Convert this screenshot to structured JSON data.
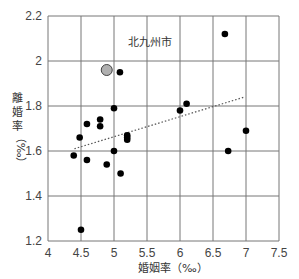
{
  "chart_data": {
    "type": "scatter",
    "title": "",
    "annotation": "北九州市",
    "xlabel": "婚姻率（‰）",
    "ylabel": "離婚率（‰）",
    "xlim": [
      4,
      7.5
    ],
    "ylim": [
      1.2,
      2.2
    ],
    "xticks": [
      "4",
      "4.5",
      "5",
      "5.5",
      "6",
      "6.5",
      "7",
      "7.5"
    ],
    "yticks": [
      "1.2",
      "1.4",
      "1.6",
      "1.8",
      "2",
      "2.2"
    ],
    "grid": true,
    "highlight": {
      "name": "北九州市",
      "x": 4.89,
      "y": 1.96,
      "color": "#b0b0b0"
    },
    "points": [
      {
        "x": 5.09,
        "y": 1.95
      },
      {
        "x": 6.68,
        "y": 2.12
      },
      {
        "x": 5.0,
        "y": 1.79
      },
      {
        "x": 6.1,
        "y": 1.81
      },
      {
        "x": 6.0,
        "y": 1.78
      },
      {
        "x": 4.59,
        "y": 1.72
      },
      {
        "x": 4.79,
        "y": 1.74
      },
      {
        "x": 4.79,
        "y": 1.71
      },
      {
        "x": 4.48,
        "y": 1.66
      },
      {
        "x": 5.2,
        "y": 1.67
      },
      {
        "x": 5.2,
        "y": 1.66
      },
      {
        "x": 5.2,
        "y": 1.65
      },
      {
        "x": 7.0,
        "y": 1.69
      },
      {
        "x": 4.39,
        "y": 1.58
      },
      {
        "x": 5.0,
        "y": 1.6
      },
      {
        "x": 6.73,
        "y": 1.6
      },
      {
        "x": 4.59,
        "y": 1.56
      },
      {
        "x": 4.89,
        "y": 1.54
      },
      {
        "x": 5.1,
        "y": 1.5
      },
      {
        "x": 4.5,
        "y": 1.25
      }
    ],
    "trendline": {
      "x1": 4.4,
      "y1": 1.61,
      "x2": 6.98,
      "y2": 1.84,
      "style": "dotted"
    },
    "colors": {
      "point": "#000000",
      "grid": "#777777",
      "trend": "#555555"
    }
  }
}
